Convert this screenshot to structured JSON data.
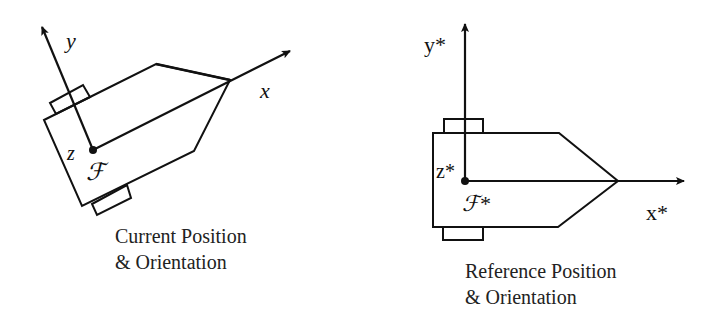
{
  "current": {
    "x_label": "x",
    "y_label": "y",
    "z_label": "z",
    "frame_label": "ℱ",
    "caption_line1": "Current Position",
    "caption_line2": "& Orientation"
  },
  "reference": {
    "x_label": "x*",
    "y_label": "y*",
    "z_label": "z*",
    "frame_label": "ℱ*",
    "caption_line1": "Reference Position",
    "caption_line2": "& Orientation"
  },
  "colors": {
    "stroke": "#111111",
    "background": "#ffffff"
  }
}
